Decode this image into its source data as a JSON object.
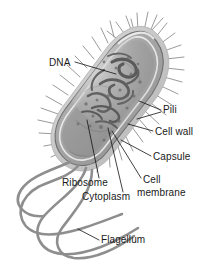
{
  "figure": {
    "style": "grayscale labeled biology illustration",
    "background_color": "#ffffff",
    "label_color": "#1a1a1a",
    "leader_line_color": "#111111",
    "cell_fill_color": "#a8a8a8",
    "cell_outline_color": "#6a6a6a",
    "capsule_color": "#c9c9c9",
    "pili_color": "#9a9a9a",
    "flagella_color": "#8e8e8e",
    "nucleoid_color": "#5f5f5f"
  },
  "labels": [
    {
      "id": "dna",
      "text": "DNA",
      "x": 49,
      "y": 66,
      "anchor": "start"
    },
    {
      "id": "pili",
      "text": "Pili",
      "x": 163,
      "y": 113,
      "anchor": "start"
    },
    {
      "id": "cell-wall",
      "text": "Cell wall",
      "x": 155,
      "y": 135,
      "anchor": "start"
    },
    {
      "id": "capsule",
      "text": "Capsule",
      "x": 153,
      "y": 160,
      "anchor": "start"
    },
    {
      "id": "cell-membrane-1",
      "text": "Cell",
      "x": 143,
      "y": 183,
      "anchor": "start"
    },
    {
      "id": "cell-membrane-2",
      "text": "membrane",
      "x": 137,
      "y": 196,
      "anchor": "start"
    },
    {
      "id": "ribosome",
      "text": "Ribosome",
      "x": 62,
      "y": 186,
      "anchor": "start"
    },
    {
      "id": "cytoplasm",
      "text": "Cytoplasm",
      "x": 82,
      "y": 200,
      "anchor": "start"
    },
    {
      "id": "flagellum",
      "text": "Flagellum",
      "x": 101,
      "y": 243,
      "anchor": "start"
    }
  ],
  "parts": [
    {
      "name": "DNA",
      "description": "nucleoid, tangled dark strand in cell interior"
    },
    {
      "name": "Pili",
      "description": "short hair-like projections radiating from cell surface"
    },
    {
      "name": "Cell wall",
      "description": "rigid layer beneath the capsule"
    },
    {
      "name": "Capsule",
      "description": "outermost slime layer surrounding the cell"
    },
    {
      "name": "Cell membrane",
      "description": "inner lipid bilayer enclosing the cytoplasm"
    },
    {
      "name": "Ribosome",
      "description": "small granules dispersed in the cytoplasm"
    },
    {
      "name": "Cytoplasm",
      "description": "gel-like interior filling the cell"
    },
    {
      "name": "Flagellum",
      "description": "long whip-like tails extending from one pole"
    }
  ]
}
